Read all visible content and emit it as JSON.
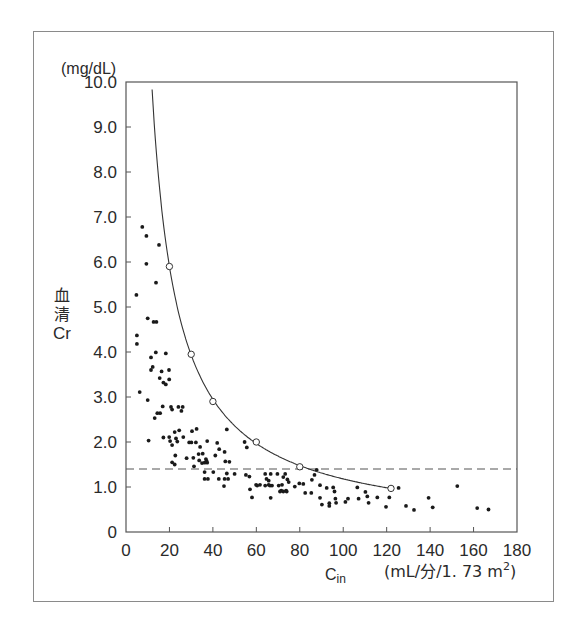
{
  "chart_data": {
    "type": "scatter",
    "title": "",
    "xlabel": "Cin",
    "xlabel_main": "C",
    "xlabel_sub": "in",
    "xunit": "(mL/分/1. 73 m",
    "xunit_sup": "2",
    "xunit_close": ")",
    "ylabel": "血清Cr",
    "ylabel_chars": [
      "血",
      "清",
      "Cr"
    ],
    "yunit": "(mg/dL)",
    "xlim": [
      0,
      180
    ],
    "ylim": [
      0,
      10
    ],
    "grid": false,
    "xticks": [
      "0",
      "20",
      "40",
      "60",
      "80",
      "100",
      "120",
      "140",
      "160",
      "180"
    ],
    "yticks": [
      "0",
      "1.0",
      "2.0",
      "3.0",
      "4.0",
      "5.0",
      "6.0",
      "7.0",
      "8.0",
      "9.0",
      "10.0"
    ],
    "reference_line": {
      "style": "dashed",
      "y": 1.4
    },
    "curve": {
      "name": "Cr vs Cin relationship",
      "style": "solid line",
      "formula_approx": "y = 118 / x",
      "x_range": [
        12,
        122
      ],
      "markers": [
        {
          "x": 20,
          "y": 5.9
        },
        {
          "x": 30,
          "y": 3.95
        },
        {
          "x": 40,
          "y": 2.9
        },
        {
          "x": 60,
          "y": 2.0
        },
        {
          "x": 80,
          "y": 1.45
        },
        {
          "x": 122,
          "y": 0.97
        }
      ]
    },
    "series": [
      {
        "name": "patients",
        "marker": "filled dot",
        "points": [
          [
            7.5,
            6.78
          ],
          [
            9.4,
            6.58
          ],
          [
            15.2,
            6.38
          ],
          [
            9.4,
            5.96
          ],
          [
            13.8,
            5.54
          ],
          [
            4.8,
            5.27
          ],
          [
            10.0,
            4.75
          ],
          [
            12.7,
            4.67
          ],
          [
            14.0,
            4.67
          ],
          [
            5.0,
            4.37
          ],
          [
            5.0,
            4.18
          ],
          [
            13.7,
            3.99
          ],
          [
            18.3,
            3.97
          ],
          [
            11.5,
            3.88
          ],
          [
            12.3,
            3.67
          ],
          [
            11.5,
            3.6
          ],
          [
            16.4,
            3.57
          ],
          [
            19.8,
            3.6
          ],
          [
            15.5,
            3.42
          ],
          [
            19.9,
            3.39
          ],
          [
            17.2,
            3.32
          ],
          [
            18.3,
            3.28
          ],
          [
            6.3,
            3.11
          ],
          [
            10.0,
            2.93
          ],
          [
            16.9,
            2.79
          ],
          [
            20.7,
            2.78
          ],
          [
            21.2,
            2.72
          ],
          [
            24.1,
            2.78
          ],
          [
            26.1,
            2.78
          ],
          [
            25.5,
            2.69
          ],
          [
            14.4,
            2.64
          ],
          [
            15.7,
            2.64
          ],
          [
            13.2,
            2.53
          ],
          [
            10.4,
            2.03
          ],
          [
            17.2,
            2.1
          ],
          [
            19.9,
            2.11
          ],
          [
            22.4,
            2.22
          ],
          [
            24.5,
            2.26
          ],
          [
            23.0,
            2.08
          ],
          [
            20.3,
            2.02
          ],
          [
            21.2,
            1.93
          ],
          [
            26.4,
            2.11
          ],
          [
            23.6,
            2.01
          ],
          [
            30.4,
            2.24
          ],
          [
            32.5,
            2.29
          ],
          [
            29.1,
            1.99
          ],
          [
            30.1,
            1.99
          ],
          [
            32.2,
            1.99
          ],
          [
            34.1,
            1.89
          ],
          [
            22.7,
            1.7
          ],
          [
            27.9,
            1.64
          ],
          [
            31.0,
            1.65
          ],
          [
            33.4,
            1.73
          ],
          [
            35.3,
            1.74
          ],
          [
            36.8,
            1.62
          ],
          [
            21.2,
            1.55
          ],
          [
            22.4,
            1.5
          ],
          [
            31.3,
            1.46
          ],
          [
            33.7,
            1.59
          ],
          [
            35.0,
            1.53
          ],
          [
            46.4,
            2.28
          ],
          [
            54.6,
            2.0
          ],
          [
            55.6,
            1.88
          ],
          [
            37.4,
            2.02
          ],
          [
            42.0,
            1.98
          ],
          [
            42.9,
            1.84
          ],
          [
            45.4,
            1.78
          ],
          [
            41.1,
            1.7
          ],
          [
            37.1,
            1.58
          ],
          [
            37.4,
            1.54
          ],
          [
            36.2,
            1.54
          ],
          [
            45.7,
            1.57
          ],
          [
            47.6,
            1.56
          ],
          [
            36.2,
            1.33
          ],
          [
            40.2,
            1.33
          ],
          [
            46.4,
            1.3
          ],
          [
            50.0,
            1.29
          ],
          [
            36.2,
            1.18
          ],
          [
            37.7,
            1.18
          ],
          [
            42.7,
            1.18
          ],
          [
            45.4,
            1.18
          ],
          [
            47.0,
            1.18
          ],
          [
            45.1,
            1.02
          ],
          [
            55.2,
            1.27
          ],
          [
            56.8,
            1.23
          ],
          [
            64.1,
            1.29
          ],
          [
            66.6,
            1.29
          ],
          [
            69.7,
            1.29
          ],
          [
            73.3,
            1.29
          ],
          [
            59.9,
            1.05
          ],
          [
            60.4,
            1.03
          ],
          [
            61.7,
            1.05
          ],
          [
            64.1,
            1.03
          ],
          [
            65.7,
            1.05
          ],
          [
            66.3,
            1.03
          ],
          [
            67.2,
            1.03
          ],
          [
            70.3,
            1.03
          ],
          [
            71.8,
            1.05
          ],
          [
            57.1,
            0.95
          ],
          [
            71.5,
            0.92
          ],
          [
            73.7,
            0.92
          ],
          [
            58.0,
            0.77
          ],
          [
            66.6,
            0.76
          ],
          [
            64.7,
            1.18
          ],
          [
            65.7,
            1.14
          ],
          [
            87.8,
            1.38
          ],
          [
            86.8,
            1.27
          ],
          [
            85.6,
            1.16
          ],
          [
            72.4,
            1.22
          ],
          [
            74.3,
            1.17
          ],
          [
            74.9,
            1.11
          ],
          [
            77.7,
            1.01
          ],
          [
            79.8,
            1.08
          ],
          [
            81.6,
            1.07
          ],
          [
            70.9,
            0.9
          ],
          [
            72.4,
            0.9
          ],
          [
            74.0,
            0.9
          ],
          [
            82.5,
            0.87
          ],
          [
            85.3,
            0.87
          ],
          [
            89.3,
            1.04
          ],
          [
            92.4,
            0.98
          ],
          [
            95.4,
            0.99
          ],
          [
            96.0,
            0.9
          ],
          [
            89.3,
            0.76
          ],
          [
            90.2,
            0.61
          ],
          [
            93.6,
            0.64
          ],
          [
            93.6,
            0.58
          ],
          [
            96.4,
            0.74
          ],
          [
            96.7,
            0.65
          ],
          [
            101.0,
            0.67
          ],
          [
            102.2,
            0.74
          ],
          [
            106.5,
            0.99
          ],
          [
            107.1,
            0.74
          ],
          [
            110.2,
            0.89
          ],
          [
            111.1,
            0.79
          ],
          [
            111.7,
            0.65
          ],
          [
            115.7,
            0.77
          ],
          [
            119.7,
            0.56
          ],
          [
            121.2,
            0.77
          ],
          [
            125.5,
            0.98
          ],
          [
            128.9,
            0.58
          ],
          [
            132.6,
            0.49
          ],
          [
            139.3,
            0.76
          ],
          [
            141.2,
            0.55
          ],
          [
            152.5,
            1.02
          ],
          [
            161.7,
            0.53
          ],
          [
            166.9,
            0.5
          ]
        ]
      }
    ]
  }
}
